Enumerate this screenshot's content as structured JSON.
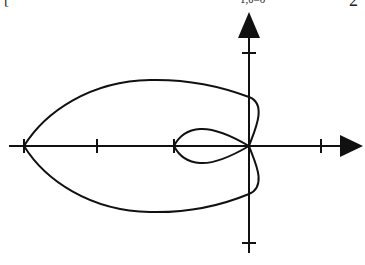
{
  "header_fragments": {
    "left": "[",
    "middle": "1,θ=0",
    "right": "2"
  },
  "diagram": {
    "type": "polar-curve",
    "colors": {
      "stroke": "#111111",
      "background": "#ffffff"
    },
    "x_axis": {
      "origin_px": [
        249,
        146
      ],
      "ticks": [
        -3,
        -2,
        -1,
        1
      ],
      "arrow": "right"
    },
    "y_axis": {
      "ticks": [
        2,
        -2
      ],
      "arrow": "up"
    },
    "curve": {
      "outer_loop": {
        "leftmost": -3,
        "y_axis_crossings": [
          1,
          -1
        ]
      },
      "inner_loop": {
        "leftmost": -1,
        "passes_through_origin": true
      }
    }
  }
}
